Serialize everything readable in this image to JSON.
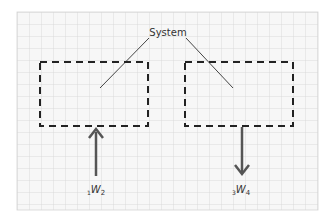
{
  "diagram": {
    "title_label": "System",
    "grid": {
      "x": 17,
      "y": 12,
      "width": 301,
      "height": 198,
      "spacing": 12,
      "color": "#d4d4d4",
      "background": "#f7f7f7"
    },
    "boxes": [
      {
        "id": "box-left",
        "x": 40,
        "y": 62,
        "width": 108,
        "height": 64
      },
      {
        "id": "box-right",
        "x": 185,
        "y": 62,
        "width": 108,
        "height": 64
      }
    ],
    "leaders": [
      {
        "x1": 149,
        "y1": 38,
        "x2": 100,
        "y2": 88
      },
      {
        "x1": 186,
        "y1": 38,
        "x2": 233,
        "y2": 88
      }
    ],
    "arrows": [
      {
        "id": "work-in",
        "direction": "up",
        "x": 96,
        "y_start": 176,
        "y_end": 128
      },
      {
        "id": "work-out",
        "direction": "down",
        "x": 242,
        "y_start": 127,
        "y_end": 175
      }
    ],
    "work_labels": [
      {
        "pre_sub": "1",
        "main": "W",
        "sub": "2"
      },
      {
        "pre_sub": "3",
        "main": "W",
        "sub": "4"
      }
    ],
    "stroke_color": "#333333"
  }
}
